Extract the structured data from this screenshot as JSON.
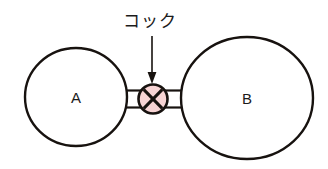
{
  "diagram": {
    "background_color": "#ffffff",
    "stroke_color": "#17120f",
    "vessels": [
      {
        "id": "vessel-a",
        "label": "A",
        "cx": 76,
        "cy": 97,
        "rx": 51,
        "ry": 49,
        "fill": "#ffffff"
      },
      {
        "id": "vessel-b",
        "label": "B",
        "cx": 247,
        "cy": 98,
        "rx": 66,
        "ry": 61,
        "fill": "#ffffff"
      }
    ],
    "valve": {
      "id": "stopcock",
      "label": "コック",
      "cx": 153,
      "cy": 99,
      "r": 14,
      "fill_color": "#f7d4d4",
      "cross_mark": "X"
    },
    "callout": {
      "text": "コック",
      "text_x": 150,
      "text_y": 22,
      "arrow_from_y": 36,
      "arrow_to_y": 82,
      "arrow_x": 152
    },
    "tubes": [
      {
        "id": "tube-left",
        "x1": 123,
        "x2": 140,
        "top": 90,
        "bottom": 108
      },
      {
        "id": "tube-right",
        "x1": 166,
        "x2": 185,
        "top": 90,
        "bottom": 108
      }
    ]
  }
}
